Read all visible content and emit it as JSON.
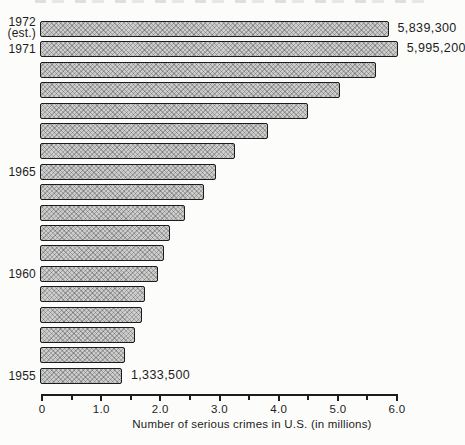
{
  "colors": {
    "background": "#fcfcfb",
    "ink": "#1c1c1c",
    "bar_fill": "#cdcdcd"
  },
  "chart_data": {
    "type": "bar",
    "orientation": "horizontal",
    "title": "",
    "xlabel": "Number of serious crimes in U.S. (in millions)",
    "ylabel": "Year",
    "xlim": [
      0,
      6.0
    ],
    "grid": false,
    "legend": null,
    "categories": [
      "1972 (est.)",
      "1971",
      "1970",
      "1969",
      "1968",
      "1967",
      "1966",
      "1965",
      "1964",
      "1963",
      "1962",
      "1961",
      "1960",
      "1959",
      "1958",
      "1957",
      "1956",
      "1955"
    ],
    "values": [
      5.8393,
      5.9952,
      5.62,
      5.02,
      4.47,
      3.8,
      3.25,
      2.92,
      2.72,
      2.4,
      2.15,
      2.05,
      1.94,
      1.73,
      1.68,
      1.55,
      1.38,
      1.3335
    ],
    "year_labels": {
      "0": [
        "1972",
        "(est.)"
      ],
      "1": [
        "1971"
      ],
      "7": [
        "1965"
      ],
      "12": [
        "1960"
      ],
      "17": [
        "1955"
      ]
    },
    "value_labels": {
      "0": "5,839,300",
      "1": "5,995,200",
      "17": "1,333,500"
    },
    "xticks": {
      "major": [
        {
          "value": 0,
          "label": "0"
        },
        {
          "value": 1,
          "label": "1.0"
        },
        {
          "value": 2,
          "label": "2.0"
        },
        {
          "value": 3,
          "label": "3.0"
        },
        {
          "value": 4,
          "label": "4.0"
        },
        {
          "value": 5,
          "label": "5.0"
        },
        {
          "value": 6,
          "label": "6.0"
        }
      ],
      "minor_step": 0.5,
      "max": 6.0
    }
  }
}
